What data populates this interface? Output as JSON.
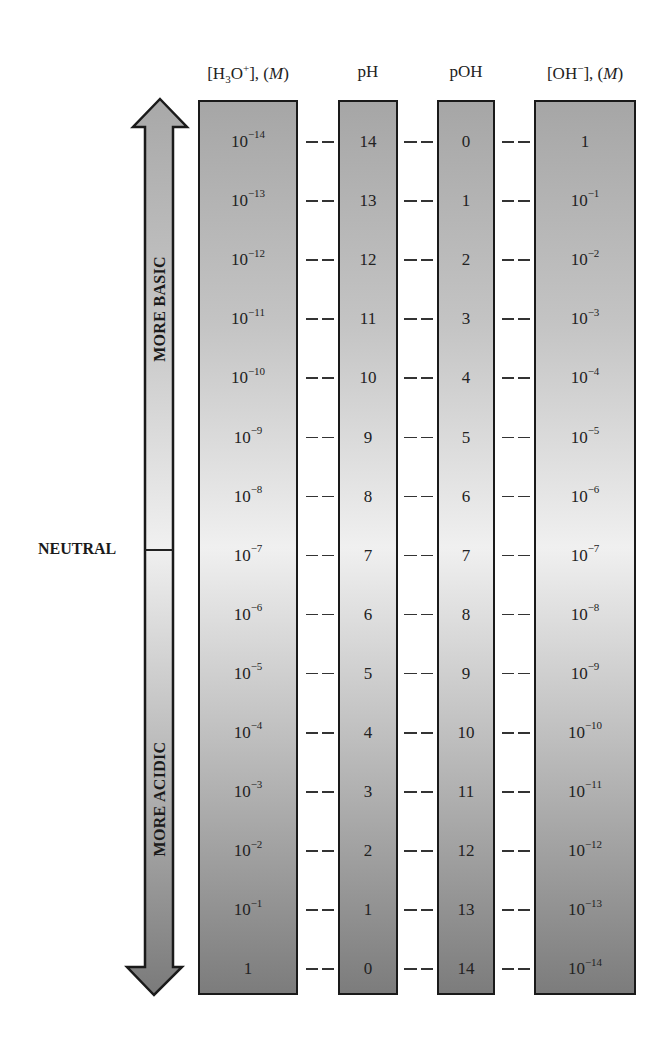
{
  "headers": {
    "h3o": "[H3O+], (M)",
    "ph": "pH",
    "poh": "pOH",
    "oh": "[OH−], (M)"
  },
  "arrow": {
    "top_label": "MORE BASIC",
    "bottom_label": "MORE ACIDIC",
    "neutral_label": "NEUTRAL"
  },
  "colors": {
    "top_fill": "#a6a6a6",
    "middle_fill": "#f0f0f0",
    "bottom_fill": "#7c7c7c",
    "border": "#1a1a1a"
  },
  "rows": [
    {
      "h3o_base": "10",
      "h3o_exp": "−14",
      "ph": "14",
      "poh": "0",
      "oh_base": "1",
      "oh_exp": ""
    },
    {
      "h3o_base": "10",
      "h3o_exp": "−13",
      "ph": "13",
      "poh": "1",
      "oh_base": "10",
      "oh_exp": "−1"
    },
    {
      "h3o_base": "10",
      "h3o_exp": "−12",
      "ph": "12",
      "poh": "2",
      "oh_base": "10",
      "oh_exp": "−2"
    },
    {
      "h3o_base": "10",
      "h3o_exp": "−11",
      "ph": "11",
      "poh": "3",
      "oh_base": "10",
      "oh_exp": "−3"
    },
    {
      "h3o_base": "10",
      "h3o_exp": "−10",
      "ph": "10",
      "poh": "4",
      "oh_base": "10",
      "oh_exp": "−4"
    },
    {
      "h3o_base": "10",
      "h3o_exp": "−9",
      "ph": "9",
      "poh": "5",
      "oh_base": "10",
      "oh_exp": "−5"
    },
    {
      "h3o_base": "10",
      "h3o_exp": "−8",
      "ph": "8",
      "poh": "6",
      "oh_base": "10",
      "oh_exp": "−6"
    },
    {
      "h3o_base": "10",
      "h3o_exp": "−7",
      "ph": "7",
      "poh": "7",
      "oh_base": "10",
      "oh_exp": "−7"
    },
    {
      "h3o_base": "10",
      "h3o_exp": "−6",
      "ph": "6",
      "poh": "8",
      "oh_base": "10",
      "oh_exp": "−8"
    },
    {
      "h3o_base": "10",
      "h3o_exp": "−5",
      "ph": "5",
      "poh": "9",
      "oh_base": "10",
      "oh_exp": "−9"
    },
    {
      "h3o_base": "10",
      "h3o_exp": "−4",
      "ph": "4",
      "poh": "10",
      "oh_base": "10",
      "oh_exp": "−10"
    },
    {
      "h3o_base": "10",
      "h3o_exp": "−3",
      "ph": "3",
      "poh": "11",
      "oh_base": "10",
      "oh_exp": "−11"
    },
    {
      "h3o_base": "10",
      "h3o_exp": "−2",
      "ph": "2",
      "poh": "12",
      "oh_base": "10",
      "oh_exp": "−12"
    },
    {
      "h3o_base": "10",
      "h3o_exp": "−1",
      "ph": "1",
      "poh": "13",
      "oh_base": "10",
      "oh_exp": "−13"
    },
    {
      "h3o_base": "1",
      "h3o_exp": "",
      "ph": "0",
      "poh": "14",
      "oh_base": "10",
      "oh_exp": "−14"
    }
  ]
}
